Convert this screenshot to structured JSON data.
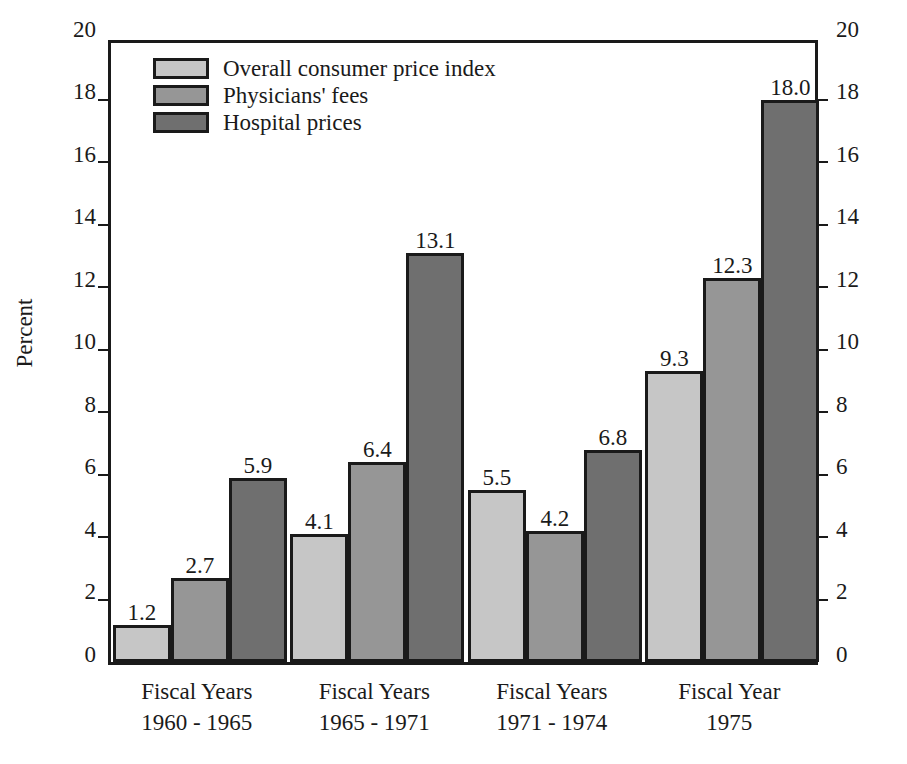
{
  "chart_data": {
    "type": "bar",
    "title": "",
    "xlabel": "",
    "ylabel": "Percent",
    "ylim": [
      0,
      20
    ],
    "ytick_step": 2,
    "yticks": [
      0,
      2,
      4,
      6,
      8,
      10,
      12,
      14,
      16,
      18,
      20
    ],
    "ytick_labels": [
      "0",
      "2",
      "4",
      "6",
      "8",
      "10",
      "12",
      "14",
      "16",
      "18",
      "20"
    ],
    "grid": false,
    "dual_axis": true,
    "right_axis_labels": [
      "0",
      "2",
      "4",
      "6",
      "8",
      "10",
      "12",
      "14",
      "16",
      "18",
      "20"
    ],
    "legend_position": "top-left",
    "categories": [
      "Fiscal Years\n1960 - 1965",
      "Fiscal Years\n1965 - 1971",
      "Fiscal Years\n1971 - 1974",
      "Fiscal Year\n1975"
    ],
    "category_lines": [
      [
        "Fiscal Years",
        "1960 - 1965"
      ],
      [
        "Fiscal Years",
        "1965 - 1971"
      ],
      [
        "Fiscal Years",
        "1971 - 1974"
      ],
      [
        "Fiscal Year",
        "1975"
      ]
    ],
    "series": [
      {
        "name": "Overall consumer price index",
        "color": "#c6c6c6",
        "values": [
          1.2,
          2.7,
          5.5,
          9.3
        ],
        "labels": [
          "1.2",
          "2.7",
          "5.5",
          "9.3"
        ]
      },
      {
        "name": "Physicians' fees",
        "color": "#969696",
        "values": [
          2.7,
          6.4,
          4.2,
          12.3
        ],
        "labels": [
          "2.7",
          "6.4",
          "4.2",
          "12.3"
        ]
      },
      {
        "name": "Hospital prices",
        "color": "#6f6f6f",
        "values": [
          5.9,
          13.1,
          6.8,
          18.0
        ],
        "labels": [
          "5.9",
          "13.1",
          "6.8",
          "18.0"
        ]
      }
    ],
    "bars_by_group": [
      {
        "category_lines": [
          "Fiscal Years",
          "1960 - 1965"
        ],
        "bars": [
          {
            "series": "Overall consumer price index",
            "value": 1.2,
            "label": "1.2"
          },
          {
            "series": "Physicians' fees",
            "value": 2.7,
            "label": "2.7"
          },
          {
            "series": "Hospital prices",
            "value": 5.9,
            "label": "5.9"
          }
        ]
      },
      {
        "category_lines": [
          "Fiscal Years",
          "1965 - 1971"
        ],
        "bars": [
          {
            "series": "Overall consumer price index",
            "value": 4.1,
            "label": "4.1"
          },
          {
            "series": "Physicians' fees",
            "value": 6.4,
            "label": "6.4"
          },
          {
            "series": "Hospital prices",
            "value": 13.1,
            "label": "13.1"
          }
        ]
      },
      {
        "category_lines": [
          "Fiscal Years",
          "1971 - 1974"
        ],
        "bars": [
          {
            "series": "Overall consumer price index",
            "value": 5.5,
            "label": "5.5"
          },
          {
            "series": "Physicians' fees",
            "value": 4.2,
            "label": "4.2"
          },
          {
            "series": "Hospital prices",
            "value": 6.8,
            "label": "6.8"
          }
        ]
      },
      {
        "category_lines": [
          "Fiscal Year",
          "1975"
        ],
        "bars": [
          {
            "series": "Overall consumer price index",
            "value": 9.3,
            "label": "9.3"
          },
          {
            "series": "Physicians' fees",
            "value": 12.3,
            "label": "12.3"
          },
          {
            "series": "Hospital prices",
            "value": 18.0,
            "label": "18.0"
          }
        ]
      }
    ]
  },
  "legend": {
    "entries": [
      {
        "label": "Overall consumer price index",
        "color": "#c6c6c6"
      },
      {
        "label": "Physicians' fees",
        "color": "#969696"
      },
      {
        "label": "Hospital prices",
        "color": "#6f6f6f"
      }
    ]
  },
  "axis": {
    "y_title": "Percent"
  },
  "colors": {
    "series_light": "#c6c6c6",
    "series_medium": "#969696",
    "series_dark": "#6f6f6f",
    "outline": "#1a1a1a",
    "background": "#ffffff"
  }
}
